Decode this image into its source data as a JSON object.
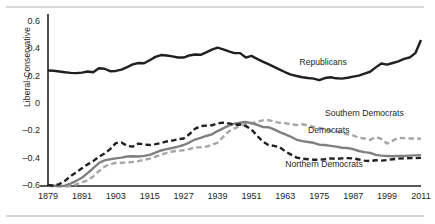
{
  "chart_data": {
    "type": "line",
    "title": "",
    "xlabel": "",
    "ylabel": "Liberal-Conservative",
    "xlim": [
      1879,
      2011
    ],
    "ylim": [
      -0.6,
      0.6
    ],
    "grid": false,
    "legend": "inline-annotations",
    "yticks": [
      "0.6",
      "0.4",
      "0.2",
      "0",
      "–0.2",
      "–0.4",
      "–0.6"
    ],
    "ytick_values": [
      0.6,
      0.4,
      0.2,
      0,
      -0.2,
      -0.4,
      -0.6
    ],
    "xticks": [
      "1879",
      "1891",
      "1903",
      "1915",
      "1927",
      "1939",
      "1951",
      "1963",
      "1975",
      "1987",
      "1999",
      "2011"
    ],
    "xtick_values": [
      1879,
      1891,
      1903,
      1915,
      1927,
      1939,
      1951,
      1963,
      1975,
      1987,
      1999,
      2011
    ],
    "series": [
      {
        "name": "Republicans",
        "color": "#231f20",
        "style": "solid",
        "width": 2.4,
        "label_x": 1968,
        "label_y": 0.3,
        "x": [
          1879,
          1881,
          1883,
          1885,
          1887,
          1889,
          1891,
          1893,
          1895,
          1897,
          1899,
          1901,
          1903,
          1905,
          1907,
          1909,
          1911,
          1913,
          1915,
          1917,
          1919,
          1921,
          1923,
          1925,
          1927,
          1929,
          1931,
          1933,
          1935,
          1937,
          1939,
          1941,
          1943,
          1945,
          1947,
          1949,
          1951,
          1953,
          1955,
          1957,
          1959,
          1961,
          1963,
          1965,
          1967,
          1969,
          1971,
          1973,
          1975,
          1977,
          1979,
          1981,
          1983,
          1985,
          1987,
          1989,
          1991,
          1993,
          1995,
          1997,
          1999,
          2001,
          2003,
          2005,
          2007,
          2009,
          2011
        ],
        "y": [
          0.245,
          0.243,
          0.238,
          0.232,
          0.228,
          0.226,
          0.23,
          0.238,
          0.232,
          0.262,
          0.258,
          0.24,
          0.242,
          0.252,
          0.27,
          0.29,
          0.3,
          0.298,
          0.32,
          0.345,
          0.358,
          0.355,
          0.348,
          0.34,
          0.34,
          0.355,
          0.362,
          0.36,
          0.378,
          0.398,
          0.412,
          0.4,
          0.385,
          0.372,
          0.372,
          0.34,
          0.352,
          0.33,
          0.31,
          0.292,
          0.272,
          0.252,
          0.232,
          0.215,
          0.205,
          0.196,
          0.19,
          0.186,
          0.174,
          0.19,
          0.196,
          0.188,
          0.186,
          0.192,
          0.2,
          0.208,
          0.222,
          0.236,
          0.268,
          0.296,
          0.288,
          0.3,
          0.312,
          0.33,
          0.34,
          0.372,
          0.468
        ]
      },
      {
        "name": "Southern Democrats",
        "color": "#a6a6a6",
        "style": "dashed",
        "width": 2.4,
        "label_x": 1977,
        "label_y": -0.075,
        "x": [
          1879,
          1881,
          1883,
          1885,
          1887,
          1889,
          1891,
          1893,
          1895,
          1897,
          1899,
          1901,
          1903,
          1905,
          1907,
          1909,
          1911,
          1913,
          1915,
          1917,
          1919,
          1921,
          1923,
          1925,
          1927,
          1929,
          1931,
          1933,
          1935,
          1937,
          1939,
          1941,
          1943,
          1945,
          1947,
          1949,
          1951,
          1953,
          1955,
          1957,
          1959,
          1961,
          1963,
          1965,
          1967,
          1969,
          1971,
          1973,
          1975,
          1977,
          1979,
          1981,
          1983,
          1985,
          1987,
          1989,
          1991,
          1993,
          1995,
          1997,
          1999,
          2001,
          2003,
          2005,
          2007,
          2009,
          2011
        ],
        "y": [
          -0.6,
          -0.6,
          -0.602,
          -0.604,
          -0.6,
          -0.588,
          -0.572,
          -0.56,
          -0.53,
          -0.492,
          -0.458,
          -0.44,
          -0.432,
          -0.43,
          -0.428,
          -0.424,
          -0.418,
          -0.408,
          -0.4,
          -0.386,
          -0.372,
          -0.358,
          -0.348,
          -0.342,
          -0.338,
          -0.33,
          -0.318,
          -0.316,
          -0.312,
          -0.3,
          -0.282,
          -0.24,
          -0.2,
          -0.178,
          -0.16,
          -0.148,
          -0.142,
          -0.13,
          -0.12,
          -0.118,
          -0.128,
          -0.138,
          -0.14,
          -0.148,
          -0.154,
          -0.148,
          -0.158,
          -0.168,
          -0.176,
          -0.184,
          -0.196,
          -0.2,
          -0.212,
          -0.222,
          -0.23,
          -0.248,
          -0.252,
          -0.262,
          -0.242,
          -0.256,
          -0.29,
          -0.268,
          -0.248,
          -0.25,
          -0.252,
          -0.252,
          -0.254
        ]
      },
      {
        "name": "Democrats",
        "color": "#808080",
        "style": "solid",
        "width": 2.4,
        "label_x": 1971,
        "label_y": -0.198,
        "x": [
          1879,
          1881,
          1883,
          1885,
          1887,
          1889,
          1891,
          1893,
          1895,
          1897,
          1899,
          1901,
          1903,
          1905,
          1907,
          1909,
          1911,
          1913,
          1915,
          1917,
          1919,
          1921,
          1923,
          1925,
          1927,
          1929,
          1931,
          1933,
          1935,
          1937,
          1939,
          1941,
          1943,
          1945,
          1947,
          1949,
          1951,
          1953,
          1955,
          1957,
          1959,
          1961,
          1963,
          1965,
          1967,
          1969,
          1971,
          1973,
          1975,
          1977,
          1979,
          1981,
          1983,
          1985,
          1987,
          1989,
          1991,
          1993,
          1995,
          1997,
          1999,
          2001,
          2003,
          2005,
          2007,
          2009,
          2011
        ],
        "y": [
          -0.598,
          -0.598,
          -0.6,
          -0.598,
          -0.582,
          -0.562,
          -0.54,
          -0.506,
          -0.47,
          -0.432,
          -0.412,
          -0.404,
          -0.398,
          -0.392,
          -0.384,
          -0.382,
          -0.384,
          -0.38,
          -0.372,
          -0.356,
          -0.34,
          -0.33,
          -0.322,
          -0.312,
          -0.3,
          -0.282,
          -0.26,
          -0.248,
          -0.234,
          -0.222,
          -0.198,
          -0.178,
          -0.158,
          -0.144,
          -0.136,
          -0.132,
          -0.14,
          -0.152,
          -0.168,
          -0.17,
          -0.186,
          -0.206,
          -0.222,
          -0.24,
          -0.262,
          -0.272,
          -0.278,
          -0.284,
          -0.298,
          -0.3,
          -0.306,
          -0.312,
          -0.32,
          -0.322,
          -0.33,
          -0.344,
          -0.352,
          -0.358,
          -0.372,
          -0.378,
          -0.38,
          -0.382,
          -0.38,
          -0.38,
          -0.378,
          -0.376,
          -0.374
        ]
      },
      {
        "name": "Northern Democrats",
        "color": "#231f20",
        "style": "dashed",
        "width": 2.4,
        "label_x": 1963,
        "label_y": -0.448,
        "x": [
          1879,
          1881,
          1883,
          1885,
          1887,
          1889,
          1891,
          1893,
          1895,
          1897,
          1899,
          1901,
          1903,
          1905,
          1907,
          1909,
          1911,
          1913,
          1915,
          1917,
          1919,
          1921,
          1923,
          1925,
          1927,
          1929,
          1931,
          1933,
          1935,
          1937,
          1939,
          1941,
          1943,
          1945,
          1947,
          1949,
          1951,
          1953,
          1955,
          1957,
          1959,
          1961,
          1963,
          1965,
          1967,
          1969,
          1971,
          1973,
          1975,
          1977,
          1979,
          1981,
          1983,
          1985,
          1987,
          1989,
          1991,
          1993,
          1995,
          1997,
          1999,
          2001,
          2003,
          2005,
          2007,
          2009,
          2011
        ],
        "y": [
          -0.592,
          -0.598,
          -0.586,
          -0.562,
          -0.528,
          -0.5,
          -0.47,
          -0.442,
          -0.418,
          -0.386,
          -0.362,
          -0.33,
          -0.286,
          -0.282,
          -0.306,
          -0.312,
          -0.29,
          -0.296,
          -0.3,
          -0.294,
          -0.286,
          -0.274,
          -0.268,
          -0.258,
          -0.252,
          -0.222,
          -0.182,
          -0.162,
          -0.158,
          -0.156,
          -0.142,
          -0.136,
          -0.142,
          -0.152,
          -0.15,
          -0.162,
          -0.186,
          -0.232,
          -0.274,
          -0.3,
          -0.306,
          -0.316,
          -0.348,
          -0.37,
          -0.392,
          -0.4,
          -0.404,
          -0.408,
          -0.408,
          -0.404,
          -0.398,
          -0.402,
          -0.398,
          -0.396,
          -0.398,
          -0.406,
          -0.414,
          -0.418,
          -0.412,
          -0.414,
          -0.41,
          -0.404,
          -0.4,
          -0.398,
          -0.396,
          -0.396,
          -0.394
        ]
      }
    ]
  },
  "axis": {
    "y_title": "Liberal-Conservative"
  }
}
